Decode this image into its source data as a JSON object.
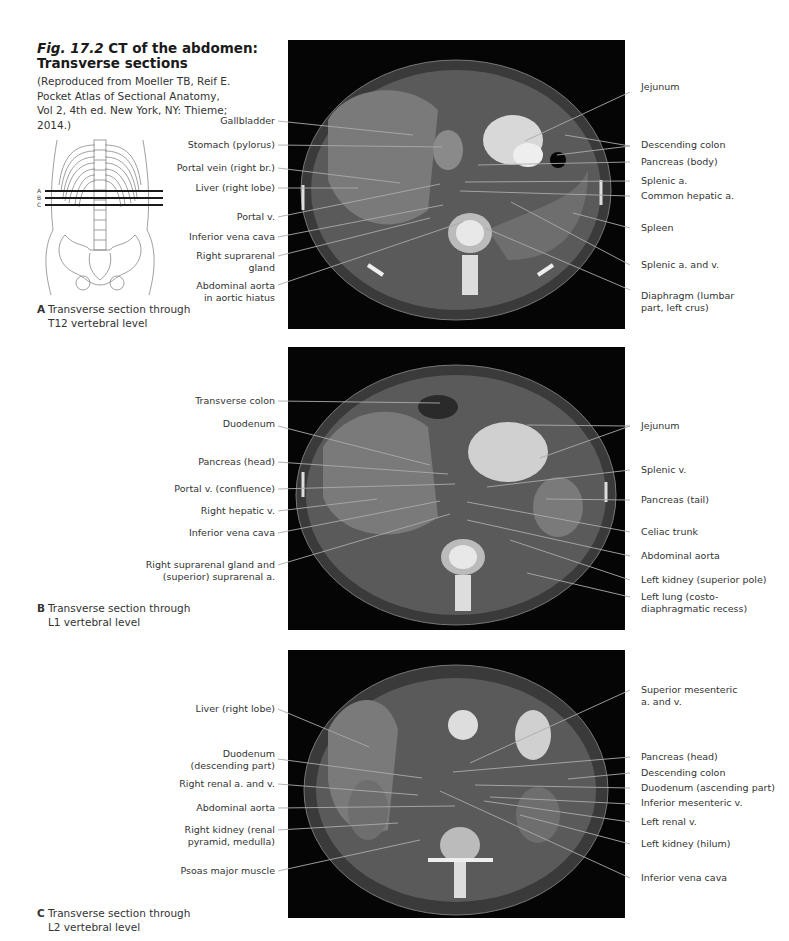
{
  "figure": {
    "number": "Fig. 17.2",
    "title_rest": "CT of the abdomen:",
    "title_line2": "Transverse sections",
    "credit": "(Reproduced from Moeller TB, Reif E. Pocket Atlas of Sectional Anatomy, Vol 2, 4th ed. New York, NY: Thieme; 2014.)",
    "skeleton_markers": [
      "A",
      "B",
      "C"
    ]
  },
  "panels": [
    {
      "letter": "A",
      "caption_line1": "Transverse section through",
      "caption_line2": "T12 vertebral level",
      "left_labels": [
        "Gallbladder",
        "Stomach (pylorus)",
        "Portal vein (right br.)",
        "Liver (right lobe)",
        "Portal v.",
        "Inferior vena cava",
        "Right suprarenal gland",
        "Abdominal aorta in aortic hiatus"
      ],
      "right_labels": [
        "Jejunum",
        "Descending colon",
        "Pancreas (body)",
        "Splenic a.",
        "Common hepatic a.",
        "Spleen",
        "Splenic a. and v.",
        "Diaphragm (lumbar part, left crus)"
      ]
    },
    {
      "letter": "B",
      "caption_line1": "Transverse section through",
      "caption_line2": "L1 vertebral level",
      "left_labels": [
        "Transverse colon",
        "Duodenum",
        "Pancreas (head)",
        "Portal v. (confluence)",
        "Right hepatic v.",
        "Inferior vena cava",
        "Right suprarenal gland and (superior) suprarenal a."
      ],
      "right_labels": [
        "Jejunum",
        "Splenic v.",
        "Pancreas (tail)",
        "Celiac trunk",
        "Abdominal aorta",
        "Left kidney (superior pole)",
        "Left lung (costo-diaphragmatic recess)"
      ]
    },
    {
      "letter": "C",
      "caption_line1": "Transverse section through",
      "caption_line2": "L2 vertebral level",
      "left_labels": [
        "Liver (right lobe)",
        "Duodenum (descending part)",
        "Right renal a. and v.",
        "Abdominal aorta",
        "Right kidney (renal pyramid, medulla)",
        "Psoas major muscle"
      ],
      "right_labels": [
        "Superior mesenteric a. and v.",
        "Pancreas (head)",
        "Descending colon",
        "Duodenum (ascending part)",
        "Inferior mesenteric v.",
        "Left renal v.",
        "Left kidney (hilum)",
        "Inferior vena cava"
      ]
    }
  ],
  "display_labels": {
    "A_left": [
      "Gallbladder",
      "Stomach (pylorus)",
      "Portal vein (right br.)",
      "Liver (right lobe)",
      "Portal v.",
      "Inferior vena cava",
      "Right suprarenal",
      "gland",
      "Abdominal aorta",
      "in aortic hiatus"
    ],
    "A_right": [
      "Jejunum",
      "Descending colon",
      "Pancreas (body)",
      "Splenic a.",
      "Common hepatic a.",
      "Spleen",
      "Splenic a. and v.",
      "Diaphragm (lumbar",
      "part, left crus)"
    ],
    "B_left": [
      "Transverse colon",
      "Duodenum",
      "Pancreas (head)",
      "Portal v. (confluence)",
      "Right hepatic v.",
      "Inferior vena cava",
      "Right suprarenal gland and",
      "(superior) suprarenal a."
    ],
    "B_right": [
      "Jejunum",
      "Splenic v.",
      "Pancreas (tail)",
      "Celiac trunk",
      "Abdominal aorta",
      "Left kidney (superior pole)",
      "Left lung (costo-",
      "diaphragmatic recess)"
    ],
    "C_left": [
      "Liver (right lobe)",
      "Duodenum",
      "(descending part)",
      "Right renal a. and v.",
      "Abdominal aorta",
      "Right kidney (renal",
      "pyramid, medulla)",
      "Psoas major muscle"
    ],
    "C_right": [
      "Superior mesenteric",
      "a. and v.",
      "Pancreas (head)",
      "Descending colon",
      "Duodenum (ascending part)",
      "Inferior mesenteric v.",
      "Left renal v.",
      "Left kidney (hilum)",
      "Inferior vena cava"
    ]
  }
}
